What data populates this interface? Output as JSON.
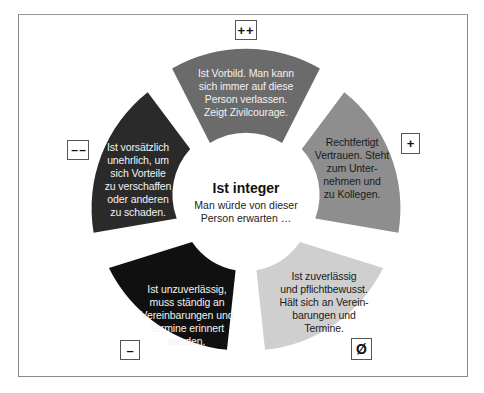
{
  "center": {
    "title": "Ist integer",
    "subtitle_line1": "Man würde von dieser",
    "subtitle_line2": "Person erwarten …"
  },
  "segments": [
    {
      "id": "top",
      "rating": "++",
      "color": "#6b6b6b",
      "lines": [
        "Ist Vorbild. Man kann",
        "sich immer auf diese",
        "Person verlassen.",
        "Zeigt Zivilcourage."
      ]
    },
    {
      "id": "right",
      "rating": "+",
      "color": "#8e8e8e",
      "lines": [
        "Rechtfertigt",
        "Vertrauen. Steht",
        "zum Unter-",
        "nehmen und",
        "zu Kollegen."
      ]
    },
    {
      "id": "bottom-right",
      "rating": "Ø",
      "color": "#cfcfcf",
      "lines": [
        "Ist zuverlässig",
        "und pflichtbewusst.",
        "Hält sich an Verein-",
        "barungen und",
        "Termine."
      ]
    },
    {
      "id": "bottom-left",
      "rating": "–",
      "color": "#101010",
      "lines": [
        "Ist unzuverlässig,",
        "muss ständig an",
        "Vereinbarungen und",
        "Termine erinnert",
        "werden."
      ]
    },
    {
      "id": "left",
      "rating": "– –",
      "color": "#2a2a2a",
      "lines": [
        "Ist vorsätzlich",
        "unehrlich, um",
        "sich Vorteile",
        "zu verschaffen",
        "oder anderen",
        "zu schaden."
      ]
    }
  ]
}
